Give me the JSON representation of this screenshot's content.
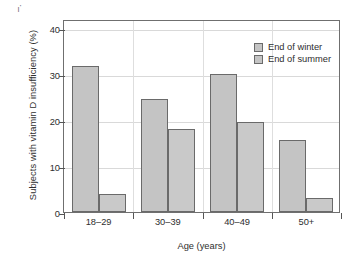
{
  "chart_data": {
    "type": "bar",
    "title": "",
    "xlabel": "Age (years)",
    "ylabel": "Subjects with vitamin D insufficiency (%)",
    "categories": [
      "18–29",
      "30–39",
      "40–49",
      "50+"
    ],
    "series": [
      {
        "name": "End of winter",
        "values": [
          31.8,
          24.5,
          30.1,
          15.6
        ]
      },
      {
        "name": "End of summer",
        "values": [
          4.0,
          18.1,
          19.5,
          3.0
        ]
      }
    ],
    "ylim": [
      0,
      42
    ],
    "yticks": [
      0,
      10,
      20,
      30,
      40
    ],
    "ytick_labels": [
      "0",
      "10",
      "20",
      "30",
      "40"
    ],
    "grid": "horizontal-and-vertical",
    "legend_position": "top-right",
    "colors": {
      "bar_fill": "#c4c4c4",
      "bar_edge": "#6a6a6a",
      "grid": "#d9d9d9",
      "axis": "#6f6f6f",
      "text": "#2e2e2e"
    },
    "artifacts": {
      "top_left_mark": "–."
    }
  }
}
